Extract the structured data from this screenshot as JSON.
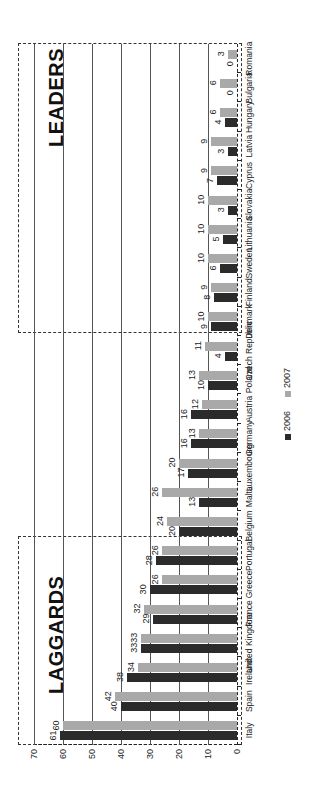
{
  "chart_data": {
    "type": "bar",
    "orientation": "rotated -90deg (categories run bottom-to-top, values increase leftward)",
    "title": "",
    "xlabel": "",
    "ylabel": "",
    "ylim": [
      0,
      70
    ],
    "yticks": [
      0,
      10,
      20,
      30,
      40,
      50,
      60,
      70
    ],
    "grid": true,
    "legend_position": "bottom-center",
    "categories": [
      "Italy",
      "Spain",
      "Ireland",
      "United Kingdom",
      "France",
      "Greece",
      "Portugal",
      "Belgium",
      "Malta",
      "Luxembourg",
      "Germany",
      "Austria",
      "Poland",
      "Czech Republic",
      "Denmark",
      "Finland",
      "Sweden",
      "Lithuania",
      "Slovakia",
      "Cyprus",
      "Latvia",
      "Hungary",
      "Bulgaria",
      "Romania"
    ],
    "series": [
      {
        "name": "2006",
        "color": "#2b2b2b",
        "values": [
          61,
          40,
          38,
          33,
          29,
          30,
          28,
          20,
          13,
          17,
          16,
          16,
          10,
          4,
          9,
          8,
          6,
          5,
          3,
          7,
          3,
          4,
          0,
          0
        ]
      },
      {
        "name": "2007",
        "color": "#a9a9a9",
        "values": [
          60,
          42,
          34,
          33,
          32,
          26,
          26,
          24,
          26,
          20,
          13,
          12,
          13,
          11,
          10,
          9,
          10,
          10,
          10,
          9,
          9,
          6,
          6,
          3
        ]
      }
    ],
    "annotations": [
      {
        "text": "LAGGARDS",
        "covers": [
          "Italy",
          "Spain",
          "Ireland",
          "United Kingdom",
          "France",
          "Greece",
          "Portugal"
        ],
        "style": "dashed box"
      },
      {
        "text": "LEADERS",
        "covers": [
          "Denmark",
          "Finland",
          "Sweden",
          "Lithuania",
          "Slovakia",
          "Cyprus",
          "Latvia",
          "Hungary",
          "Bulgaria",
          "Romania"
        ],
        "style": "dashed box"
      }
    ]
  },
  "legend": {
    "items": [
      {
        "label": "2006",
        "color": "#2b2b2b"
      },
      {
        "label": "2007",
        "color": "#a9a9a9"
      }
    ]
  },
  "boxes": {
    "laggards": "LAGGARDS",
    "leaders": "LEADERS"
  }
}
